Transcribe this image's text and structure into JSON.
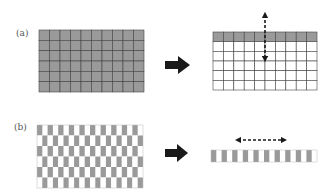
{
  "panels": [
    {
      "label": "(a)",
      "before": {
        "cols": 10,
        "rows": 6,
        "fill": "all-gray"
      },
      "after": {
        "cols": 10,
        "rows": 6,
        "fill": "top-row-gray",
        "arrow": "vertical-double-dashed"
      }
    },
    {
      "label": "(b)",
      "before": {
        "cols": 10,
        "rows": 6,
        "fill": "half-gray-brick"
      },
      "after": {
        "cols": 10,
        "rows": 1,
        "fill": "half-gray-strip",
        "arrow": "horizontal-double-dashed"
      }
    }
  ],
  "colors": {
    "gray": "#9a9a9a",
    "line": "#444444",
    "white": "#ffffff",
    "arrow": "#1a1a1a"
  }
}
